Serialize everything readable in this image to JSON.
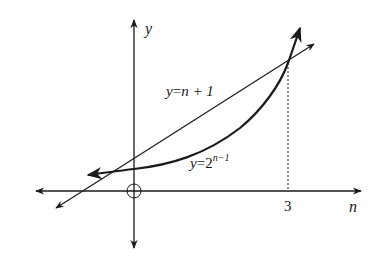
{
  "axes": {
    "x_label": "n",
    "y_label": "y",
    "x_tick": "3"
  },
  "curves": {
    "line_label_y": "y",
    "line_label_eq": "=",
    "line_label_rhs": "n + 1",
    "exp_label_y": "y",
    "exp_label_eq": "=",
    "exp_label_base": "2",
    "exp_label_exponent": "n−1"
  },
  "colors": {
    "ink": "#1a1a1a",
    "background": "#ffffff"
  }
}
